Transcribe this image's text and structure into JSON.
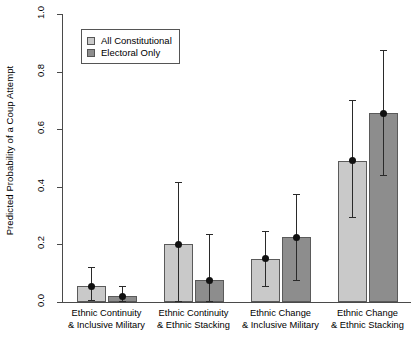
{
  "chart_data": {
    "type": "bar",
    "title": "",
    "xlabel": "",
    "ylabel": "Predicted Probability of a Coup Attempt",
    "ylim": [
      0,
      1.0
    ],
    "ytick_labels": [
      "0.0",
      "0.2",
      "0.4",
      "0.6",
      "0.8",
      "1.0"
    ],
    "ytick_values": [
      0.0,
      0.2,
      0.4,
      0.6,
      0.8,
      1.0
    ],
    "grid": false,
    "legend_position": "top-left",
    "categories": [
      "Ethnic Continuity\n& Inclusive Military",
      "Ethnic Continuity\n& Ethnic Stacking",
      "Ethnic Change\n& Inclusive Military",
      "Ethnic Change\n& Ethnic Stacking"
    ],
    "category_lines": [
      [
        "Ethnic Continuity",
        "& Inclusive Military"
      ],
      [
        "Ethnic Continuity",
        "& Ethnic Stacking"
      ],
      [
        "Ethnic Change",
        "& Inclusive Military"
      ],
      [
        "Ethnic Change",
        "& Ethnic Stacking"
      ]
    ],
    "series": [
      {
        "name": "All Constitutional",
        "color": "#c9c9c9",
        "values": [
          0.055,
          0.2,
          0.15,
          0.49
        ],
        "ci_lower": [
          0.008,
          0.005,
          0.055,
          0.295
        ],
        "ci_upper": [
          0.12,
          0.415,
          0.245,
          0.7
        ]
      },
      {
        "name": "Electoral Only",
        "color": "#8d8d8d",
        "values": [
          0.02,
          0.075,
          0.225,
          0.655
        ],
        "ci_lower": [
          0.003,
          0.005,
          0.075,
          0.44
        ],
        "ci_upper": [
          0.055,
          0.235,
          0.375,
          0.875
        ]
      }
    ]
  },
  "legend": {
    "items": [
      {
        "label": "All Constitutional",
        "swatch": "light"
      },
      {
        "label": "Electoral Only",
        "swatch": "dark"
      }
    ]
  },
  "caption": ""
}
